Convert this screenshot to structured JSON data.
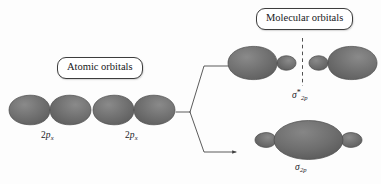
{
  "figure": {
    "background_color": "#fdfdfd",
    "lobe_fill_color": "#6e6e6e",
    "lobe_stroke_color": "#4a4a4a",
    "line_color": "#3d3d3d"
  },
  "callouts": {
    "atomic": "Atomic orbitals",
    "molecular": "Molecular orbitals"
  },
  "atomic_orbitals": [
    {
      "id": "left-2px",
      "label_prefix": "2",
      "label_letter": "p",
      "label_subscript": "x",
      "shape": "two-lobe-dumbbell"
    },
    {
      "id": "right-2px",
      "label_prefix": "2",
      "label_letter": "p",
      "label_subscript": "x",
      "shape": "two-lobe-dumbbell"
    }
  ],
  "molecular_orbitals": [
    {
      "id": "sigma-star-2p",
      "type": "antibonding",
      "label_letter": "σ",
      "label_superscript": "*",
      "label_subscript": "2p",
      "shape": "two-separated-lobes-with-nodal-plane",
      "nodal_plane": "dashed-vertical"
    },
    {
      "id": "sigma-2p",
      "type": "bonding",
      "label_letter": "σ",
      "label_superscript": "",
      "label_subscript": "2p",
      "shape": "large-central-ellipse-with-small-end-lobes",
      "nodal_plane": "none"
    }
  ],
  "connectors": {
    "stem": "horizontal-line-from-atomic-orbitals",
    "branches": [
      {
        "id": "branch-up",
        "target": "sigma-star-2p",
        "arrowhead": true
      },
      {
        "id": "branch-down",
        "target": "sigma-2p",
        "arrowhead": true
      }
    ]
  }
}
